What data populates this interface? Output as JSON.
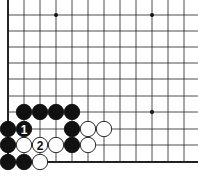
{
  "board": {
    "x_lines": [
      8,
      24,
      40,
      56,
      72,
      88,
      104,
      120,
      136,
      152,
      168,
      184
    ],
    "y_lines": [
      15,
      31,
      47,
      63,
      79,
      96,
      112,
      129,
      145,
      162
    ],
    "left_edge": true,
    "bottom_edge": true,
    "star_points": [
      [
        3,
        0
      ],
      [
        9,
        0
      ],
      [
        9,
        6
      ]
    ],
    "stone_radius": 8
  },
  "stones": [
    {
      "color": "black",
      "col": 1,
      "row": 6
    },
    {
      "color": "black",
      "col": 2,
      "row": 6
    },
    {
      "color": "black",
      "col": 3,
      "row": 6
    },
    {
      "color": "black",
      "col": 4,
      "row": 6
    },
    {
      "color": "black",
      "col": 0,
      "row": 7
    },
    {
      "color": "black",
      "col": 1,
      "row": 7,
      "label": "1"
    },
    {
      "color": "black",
      "col": 4,
      "row": 7
    },
    {
      "color": "white",
      "col": 5,
      "row": 7
    },
    {
      "color": "white",
      "col": 6,
      "row": 7
    },
    {
      "color": "black",
      "col": 0,
      "row": 8
    },
    {
      "color": "white",
      "col": 1,
      "row": 8
    },
    {
      "color": "white",
      "col": 2,
      "row": 8,
      "label": "2"
    },
    {
      "color": "white",
      "col": 3,
      "row": 8
    },
    {
      "color": "black",
      "col": 4,
      "row": 8
    },
    {
      "color": "white",
      "col": 5,
      "row": 8
    },
    {
      "color": "black",
      "col": 0,
      "row": 9
    },
    {
      "color": "black",
      "col": 1,
      "row": 9
    },
    {
      "color": "white",
      "col": 2,
      "row": 9
    }
  ]
}
